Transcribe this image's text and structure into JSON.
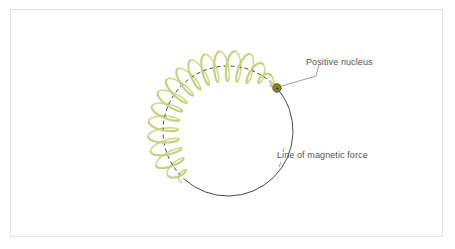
{
  "labels": {
    "nucleus": "Positive nucleus",
    "force_line": "Line of magnetic force"
  },
  "nucleus": {
    "symbol": "+",
    "x": 277,
    "y": 88,
    "r": 4
  },
  "circle": {
    "cx": 228,
    "cy": 131,
    "r": 65
  },
  "colors": {
    "helix": "#c8d27a",
    "circle": "#333333",
    "nucleus_fill": "#8a8a2a",
    "leader": "#555555",
    "frame_border": "#e2e2e2"
  }
}
